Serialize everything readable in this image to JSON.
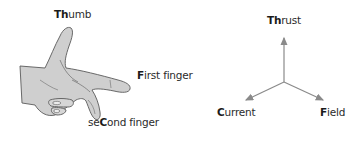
{
  "figure": {
    "hand_diagram": {
      "labels": [
        {
          "id": "thumb",
          "bold": "Th",
          "rest": "umb",
          "full": "Thumb"
        },
        {
          "id": "first-finger",
          "bold": "F",
          "rest": "irst finger",
          "full": "First finger"
        },
        {
          "id": "second-finger",
          "pre": "se",
          "bold": "C",
          "rest": "ond finger",
          "full": "seCond finger"
        }
      ]
    },
    "axes_diagram": {
      "labels": [
        {
          "id": "thrust",
          "bold": "Th",
          "rest": "rust",
          "full": "Thrust"
        },
        {
          "id": "current",
          "bold": "C",
          "rest": "urrent",
          "full": "Current"
        },
        {
          "id": "field",
          "bold": "F",
          "rest": "ield",
          "full": "Field"
        }
      ],
      "arrows": [
        "up: Thrust",
        "down-left: Current",
        "down-right: Field"
      ]
    },
    "colors": {
      "hand_fill": "#cfcfcf",
      "hand_outline": "#5a5a5a",
      "arrow": "#8a8a8a",
      "text": "#2b2b2b"
    }
  }
}
